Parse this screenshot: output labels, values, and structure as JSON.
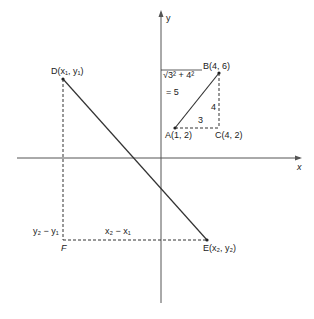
{
  "axes": {
    "x_label": "x",
    "y_label": "y"
  },
  "points": {
    "A": "A(1, 2)",
    "B": "B(4, 6)",
    "C": "C(4, 2)",
    "D": "D(x₁, y₁)",
    "E": "E(x₂, y₂)",
    "F": "F"
  },
  "labels": {
    "distance_expr": "√3² + 4²",
    "distance_result": "= 5",
    "horizontal_leg": "3",
    "vertical_leg": "4",
    "dx": "x₂ − x₁",
    "dy": "y₂ − y₁"
  },
  "colors": {
    "line": "#333333",
    "axis": "#555555"
  }
}
